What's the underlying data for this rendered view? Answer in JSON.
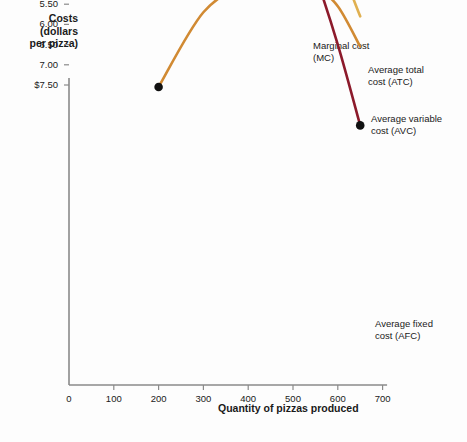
{
  "chart_data": {
    "type": "line",
    "title": "",
    "ylabel": "Costs\n(dollars\nper pizza)",
    "xlabel": "Quantity of pizzas produced",
    "xlim": [
      0,
      700
    ],
    "ylim": [
      0,
      7.75
    ],
    "grid": false,
    "legend_position": "inline-annotations",
    "x_ticks": [
      0,
      100,
      200,
      300,
      400,
      500,
      600,
      700
    ],
    "x_tick_labels": [
      "0",
      "100",
      "200",
      "300",
      "400",
      "500",
      "600",
      "700"
    ],
    "y_ticks": [
      0.5,
      1.0,
      1.5,
      2.0,
      2.5,
      3.0,
      3.5,
      4.0,
      4.5,
      5.0,
      5.5,
      6.0,
      6.5,
      7.0,
      7.5
    ],
    "y_tick_labels": [
      "0.50",
      "1.00",
      "1.50",
      "2.00",
      "2.50",
      "3.00",
      "3.50",
      "4.00",
      "4.50",
      "5.00",
      "5.50",
      "6.00",
      "6.50",
      "7.00",
      "$7.50"
    ],
    "series": [
      {
        "name": "Marginal cost (MC)",
        "short": "MC",
        "color": "#8C1A2B",
        "x": [
          200,
          300,
          400,
          450,
          500,
          550,
          600,
          650
        ],
        "values": [
          3.35,
          2.75,
          2.5,
          2.57,
          3.4,
          4.8,
          6.5,
          8.5
        ]
      },
      {
        "name": "Average total cost (ATC)",
        "short": "ATC",
        "color": "#D18A33",
        "x": [
          200,
          300,
          400,
          450,
          500,
          550,
          600,
          650
        ],
        "values": [
          7.55,
          5.7,
          4.95,
          4.75,
          4.8,
          5.05,
          5.55,
          6.55
        ]
      },
      {
        "name": "Average variable cost (AVC)",
        "short": "AVC",
        "color": "#E0B050",
        "x": [
          200,
          300,
          400,
          450,
          500,
          550,
          600,
          650
        ],
        "values": [
          4.05,
          3.2,
          3.0,
          2.95,
          3.1,
          3.55,
          4.45,
          5.8
        ]
      },
      {
        "name": "Average fixed cost (AFC)",
        "short": "AFC",
        "color": "#E0B050",
        "x": [
          200,
          300,
          400,
          450,
          500,
          550,
          600,
          650
        ],
        "values": [
          3.35,
          2.4,
          1.8,
          1.65,
          1.5,
          1.4,
          1.32,
          1.28
        ]
      }
    ]
  },
  "labels": {
    "mc": "Marginal cost\n(MC)",
    "atc": "Average total\ncost (ATC)",
    "avc": "Average variable\ncost (AVC)",
    "afc": "Average fixed\ncost (AFC)"
  },
  "colors": {
    "mc": "#8C1A2B",
    "atc": "#D18A33",
    "avc": "#E0B050",
    "afc": "#E0B050",
    "axis": "#8a8a8a",
    "marker": "#111111",
    "text": "#1a1a1a",
    "background": "#fdfdfd"
  }
}
